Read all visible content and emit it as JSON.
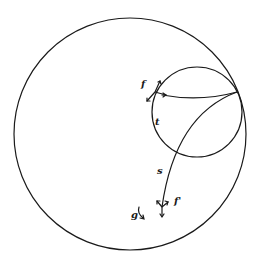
{
  "diagram": {
    "colors": {
      "stroke": "#1a1a1a",
      "background": "#ffffff"
    },
    "labels": {
      "f": "f",
      "t": "t",
      "s": "s",
      "f_prime": "f'",
      "g": "g"
    }
  }
}
